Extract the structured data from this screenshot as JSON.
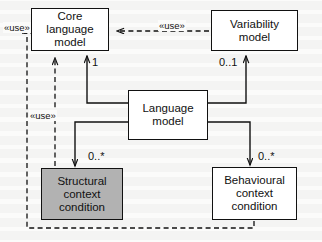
{
  "diagram": {
    "type": "uml-class-diagram",
    "canvas": {
      "width": 322,
      "height": 242,
      "background": "#fbfbfa"
    },
    "colors": {
      "stroke": "#111111",
      "box_fill": "#ffffff",
      "shaded_fill": "#b2b2b2",
      "text": "#111111"
    },
    "nodes": [
      {
        "id": "core-language-model",
        "label": "Core language\nmodel",
        "line1": "Core language",
        "line2": "model",
        "shaded": false,
        "x": 31,
        "y": 8,
        "w": 78,
        "h": 43
      },
      {
        "id": "variability-model",
        "label": "Variability\nmodel",
        "line1": "Variability",
        "line2": "model",
        "shaded": false,
        "x": 211,
        "y": 10,
        "w": 87,
        "h": 41
      },
      {
        "id": "language-model",
        "label": "Language\nmodel",
        "line1": "Language",
        "line2": "model",
        "shaded": false,
        "x": 128,
        "y": 90,
        "w": 80,
        "h": 50
      },
      {
        "id": "structural-context-condition",
        "label": "Structural\ncontext\ncondition",
        "line1": "Structural",
        "line2": "context",
        "line3": "condition",
        "shaded": true,
        "x": 41,
        "y": 168,
        "w": 82,
        "h": 52
      },
      {
        "id": "behavioural-context-condition",
        "label": "Behavioural\ncontext\ncondition",
        "line1": "Behavioural",
        "line2": "context",
        "line3": "condition",
        "shaded": false,
        "x": 212,
        "y": 167,
        "w": 85,
        "h": 53
      }
    ],
    "multiplicities": [
      {
        "id": "mult-core-language",
        "value": "1",
        "x": 92,
        "y": 56
      },
      {
        "id": "mult-variability",
        "value": "0..1",
        "x": 219,
        "y": 56
      },
      {
        "id": "mult-structural",
        "value": "0..*",
        "x": 88,
        "y": 150
      },
      {
        "id": "mult-behavioural",
        "value": "0..*",
        "x": 258,
        "y": 150
      }
    ],
    "stereotypes": [
      {
        "id": "use-left-top",
        "value": "«use»",
        "x": 3,
        "y": 22
      },
      {
        "id": "use-left-mid",
        "value": "«use»",
        "x": 29,
        "y": 110
      },
      {
        "id": "use-top-right",
        "value": "«use»",
        "x": 158,
        "y": 20
      }
    ],
    "relationships": [
      {
        "id": "composition-core",
        "kind": "composition",
        "from": "language-model",
        "to": "core-language-model",
        "multiplicity": "1"
      },
      {
        "id": "composition-variability",
        "kind": "composition",
        "from": "language-model",
        "to": "variability-model",
        "multiplicity": "0..1"
      },
      {
        "id": "composition-structural",
        "kind": "composition",
        "from": "language-model",
        "to": "structural-context-condition",
        "multiplicity": "0..*"
      },
      {
        "id": "composition-behavioural",
        "kind": "composition",
        "from": "language-model",
        "to": "behavioural-context-condition",
        "multiplicity": "0..*"
      },
      {
        "id": "dependency-variability-core",
        "kind": "dependency",
        "from": "variability-model",
        "to": "core-language-model",
        "stereotype": "«use»"
      },
      {
        "id": "dependency-structural-core",
        "kind": "dependency",
        "from": "structural-context-condition",
        "to": "core-language-model",
        "stereotype": "«use»"
      },
      {
        "id": "dependency-behavioural-core",
        "kind": "dependency",
        "from": "behavioural-context-condition",
        "to": "core-language-model",
        "stereotype": "«use»"
      }
    ]
  }
}
